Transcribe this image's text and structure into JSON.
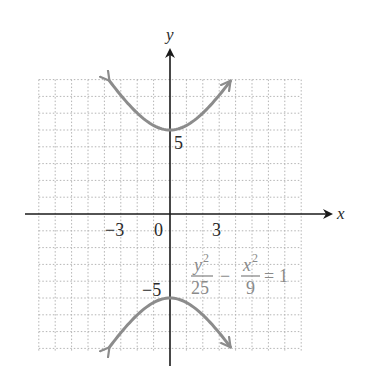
{
  "chart_data": {
    "type": "line",
    "title": "",
    "equation": {
      "lhs_term1_numerator": "y",
      "lhs_term1_numerator_exp": "2",
      "lhs_term1_denominator": "25",
      "operator": "−",
      "lhs_term2_numerator": "x",
      "lhs_term2_numerator_exp": "2",
      "lhs_term2_denominator": "9",
      "equals": "=",
      "rhs": "1",
      "text": "y^2/25 − x^2/9 = 1"
    },
    "xlabel": "x",
    "ylabel": "y",
    "xlim": [
      -8,
      8
    ],
    "ylim": [
      -8,
      8
    ],
    "grid": true,
    "grid_style": "dotted",
    "x_ticks": [
      {
        "value": -3,
        "label": "−3"
      },
      {
        "value": 0,
        "label": "0"
      },
      {
        "value": 3,
        "label": "3"
      }
    ],
    "y_ticks": [
      {
        "value": 5,
        "label": "5"
      },
      {
        "value": -5,
        "label": "−5"
      }
    ],
    "series": [
      {
        "name": "upper branch",
        "description": "y = 5*sqrt(1 + x^2/9), vertex (0,5), arrows at both ends",
        "points": [
          [
            -3.75,
            8
          ],
          [
            -3,
            6.4
          ],
          [
            -2,
            6.01
          ],
          [
            -1,
            5.27
          ],
          [
            0,
            5
          ],
          [
            1,
            5.27
          ],
          [
            2,
            6.01
          ],
          [
            3,
            6.4
          ],
          [
            3.75,
            8
          ]
        ]
      },
      {
        "name": "lower branch",
        "description": "y = -5*sqrt(1 + x^2/9), vertex (0,-5), arrows at both ends",
        "points": [
          [
            -3.75,
            -8
          ],
          [
            -3,
            -6.4
          ],
          [
            -2,
            -6.01
          ],
          [
            -1,
            -5.27
          ],
          [
            0,
            -5
          ],
          [
            1,
            -5.27
          ],
          [
            2,
            -6.01
          ],
          [
            3,
            -6.4
          ],
          [
            3.75,
            -8
          ]
        ]
      }
    ],
    "vertices": [
      [
        0,
        5
      ],
      [
        0,
        -5
      ]
    ],
    "curve_color": "#8c8c8c",
    "grid_color": "#b4b4b4",
    "axis_color": "#1a1a1a"
  },
  "labels": {
    "x_axis": "x",
    "y_axis": "y",
    "tick_neg3": "−3",
    "tick_0": "0",
    "tick_3": "3",
    "tick_5": "5",
    "tick_neg5": "−5",
    "eq_y": "y",
    "eq_y_exp": "2",
    "eq_25": "25",
    "eq_minus": "−",
    "eq_x": "x",
    "eq_x_exp": "2",
    "eq_9": "9",
    "eq_equals": "=",
    "eq_1": "1"
  }
}
